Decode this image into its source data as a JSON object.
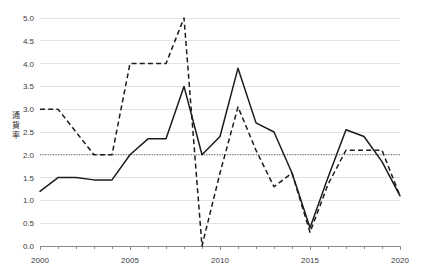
{
  "chart_data": {
    "type": "line",
    "title": "",
    "xlabel": "",
    "ylabel": "通貨率",
    "x": [
      2000,
      2001,
      2002,
      2003,
      2004,
      2005,
      2006,
      2007,
      2008,
      2009,
      2010,
      2011,
      2012,
      2013,
      2014,
      2015,
      2016,
      2017,
      2018,
      2019,
      2020
    ],
    "xlim": [
      2000,
      2020
    ],
    "ylim": [
      0.0,
      5.0
    ],
    "xticks": [
      2000,
      2005,
      2010,
      2015,
      2020
    ],
    "xtick_labels": [
      "2000",
      "2005",
      "2010",
      "2015",
      "2020"
    ],
    "yticks": [
      0.0,
      0.5,
      1.0,
      1.5,
      2.0,
      2.5,
      3.0,
      3.5,
      4.0,
      4.5,
      5.0
    ],
    "ytick_labels": [
      "0.0",
      "0.5",
      "1.0",
      "1.5",
      "2.0",
      "2.5",
      "3.0",
      "3.5",
      "4.0",
      "4.5",
      "5.0"
    ],
    "grid": true,
    "grid_axis": "y",
    "legend": false,
    "legend_position": "none",
    "series": [
      {
        "name": "solid-series",
        "style": "solid",
        "color": "#1c1c1c",
        "values": [
          1.2,
          1.5,
          1.5,
          1.45,
          1.45,
          2.0,
          2.35,
          2.35,
          3.5,
          2.0,
          2.4,
          3.9,
          2.7,
          2.5,
          1.6,
          0.4,
          1.5,
          2.55,
          2.4,
          1.85,
          1.1
        ]
      },
      {
        "name": "dashed-series",
        "style": "dashed",
        "color": "#1c1c1c",
        "values": [
          3.0,
          3.0,
          2.5,
          2.0,
          2.0,
          4.0,
          4.0,
          4.0,
          5.0,
          0.0,
          1.6,
          3.05,
          2.1,
          1.3,
          1.6,
          0.3,
          1.35,
          2.1,
          2.1,
          2.1,
          1.1
        ]
      }
    ],
    "reference_lines": [
      {
        "name": "threshold-2",
        "orientation": "horizontal",
        "value": 2.0,
        "style": "dotted",
        "color": "#555555"
      }
    ]
  },
  "ytick_label_0": "0.0",
  "ytick_label_1": "0.5",
  "ytick_label_2": "1.0",
  "ytick_label_3": "1.5",
  "ytick_label_4": "2.0",
  "ytick_label_5": "2.5",
  "ytick_label_6": "3.0",
  "ytick_label_7": "3.5",
  "ytick_label_8": "4.0",
  "ytick_label_9": "4.5",
  "ytick_label_10": "5.0",
  "xtick_label_0": "2000",
  "xtick_label_1": "2005",
  "xtick_label_2": "2010",
  "xtick_label_3": "2015",
  "xtick_label_4": "2020"
}
